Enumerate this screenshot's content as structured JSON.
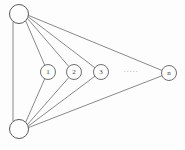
{
  "figure": {
    "type": "graph-diagram",
    "title": "",
    "background_color": "#fdfdfd",
    "edge_color": "#6b6b6b",
    "node_fill": "#fefefe",
    "node_stroke": "#5f5f5f",
    "label_color": "#3a3a3a"
  },
  "hubs": [
    {
      "id": "hub-top",
      "label": "",
      "cx": 19,
      "cy": 14,
      "r": 9.5
    },
    {
      "id": "hub-bottom",
      "label": "",
      "cx": 19,
      "cy": 129,
      "r": 9.5
    }
  ],
  "middle_nodes": [
    {
      "id": "node-1",
      "label": "1",
      "cx": 48,
      "cy": 72,
      "r": 7.5
    },
    {
      "id": "node-2",
      "label": "2",
      "cx": 74,
      "cy": 72,
      "r": 7.5
    },
    {
      "id": "node-3",
      "label": "3",
      "cx": 101,
      "cy": 72,
      "r": 7.5
    },
    {
      "id": "node-n",
      "label": "n",
      "cx": 169,
      "cy": 73,
      "r": 7.5
    }
  ],
  "ellipsis": {
    "id": "ellipsis",
    "label": "·····",
    "cx": 131,
    "cy": 72
  },
  "edges": [
    {
      "from": "hub-top",
      "to": "hub-bottom"
    },
    {
      "from": "hub-top",
      "to": "node-1"
    },
    {
      "from": "hub-top",
      "to": "node-2"
    },
    {
      "from": "hub-top",
      "to": "node-3"
    },
    {
      "from": "hub-top",
      "to": "node-n"
    },
    {
      "from": "hub-bottom",
      "to": "node-1"
    },
    {
      "from": "hub-bottom",
      "to": "node-2"
    },
    {
      "from": "hub-bottom",
      "to": "node-3"
    },
    {
      "from": "hub-bottom",
      "to": "node-n"
    }
  ]
}
